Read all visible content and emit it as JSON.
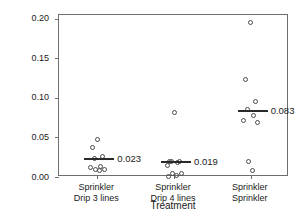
{
  "chart_data": {
    "type": "scatter",
    "title": "",
    "xlabel": "Treatment",
    "ylabel": "% Plants with Downy Mildew",
    "ylim": [
      0.0,
      0.205
    ],
    "yticks": [
      0.0,
      0.05,
      0.1,
      0.15,
      0.2
    ],
    "ytick_labels": [
      "0.00",
      "0.05",
      "0.10",
      "0.15",
      "0.20"
    ],
    "grid": false,
    "legend": "none",
    "categories": [
      "Sprinkler\nDrip 3 lines",
      "Sprinkler\nDrip 4 lines",
      "Sprinkler\nSprinkler"
    ],
    "category_lines": [
      [
        "Sprinkler",
        "Drip 3 lines"
      ],
      [
        "Sprinkler",
        "Drip 4 lines"
      ],
      [
        "Sprinkler",
        "Sprinkler"
      ]
    ],
    "groups": [
      {
        "name": "Sprinkler Drip 3 lines",
        "mean": 0.023,
        "mean_label": "0.023",
        "values": [
          0.048,
          0.037,
          0.026,
          0.024,
          0.013,
          0.012,
          0.01,
          0.009,
          0.008
        ]
      },
      {
        "name": "Sprinkler Drip 4 lines",
        "mean": 0.019,
        "mean_label": "0.019",
        "values": [
          0.082,
          0.02,
          0.019,
          0.019,
          0.018,
          0.014,
          0.005,
          0.004,
          0.002,
          0.001
        ]
      },
      {
        "name": "Sprinkler Sprinkler",
        "mean": 0.083,
        "mean_label": "0.083",
        "values": [
          0.196,
          0.124,
          0.095,
          0.085,
          0.078,
          0.071,
          0.069,
          0.019,
          0.008
        ]
      }
    ],
    "marker": "open-circle",
    "colors": {
      "marker": "#4a4a4a",
      "mean_line": "#2a2a2a",
      "axis": "#6e6e6e",
      "text": "#1a1a1a",
      "background": "#ffffff"
    }
  }
}
